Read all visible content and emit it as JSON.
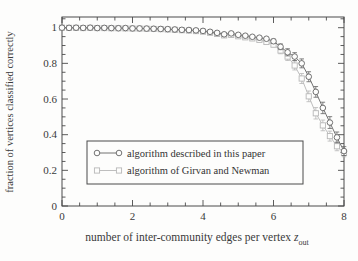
{
  "figure": {
    "background": "#fdfdfc",
    "frame_color": "#4a4a4a",
    "text_color": "#3a3a3a",
    "xlabel": {
      "main": "number of inter-community edges per vertex ",
      "var": "z",
      "sub": "out"
    },
    "ylabel": "fraction of vertices classified correctly",
    "legend": {
      "items": [
        {
          "label": "algorithm described in this paper",
          "marker": "circle"
        },
        {
          "label": "algorithm of Girvan and Newman",
          "marker": "square"
        }
      ]
    }
  },
  "chart_data": {
    "type": "line",
    "title": "",
    "xlabel": "number of inter-community edges per vertex z_out",
    "ylabel": "fraction of vertices classified correctly",
    "xlim": [
      0,
      8
    ],
    "ylim": [
      0,
      1.06
    ],
    "xticks": {
      "major": [
        0,
        2,
        4,
        6,
        8
      ],
      "minor_step": 0.5
    },
    "yticks": {
      "major": [
        0,
        0.2,
        0.4,
        0.6,
        0.8,
        1
      ],
      "major_labels": [
        "0",
        "0.2",
        "0.4",
        "0.6",
        "0.8",
        "1"
      ],
      "minor_step": 0.05
    },
    "grid": false,
    "legend_position": "inside lower-left box",
    "x": [
      0,
      0.2,
      0.4,
      0.6,
      0.8,
      1,
      1.2,
      1.4,
      1.6,
      1.8,
      2,
      2.2,
      2.4,
      2.6,
      2.8,
      3,
      3.2,
      3.4,
      3.6,
      3.8,
      4,
      4.2,
      4.4,
      4.6,
      4.8,
      5,
      5.2,
      5.4,
      5.6,
      5.8,
      6,
      6.2,
      6.4,
      6.6,
      6.8,
      7,
      7.2,
      7.4,
      7.6,
      7.8,
      8
    ],
    "series": [
      {
        "name": "algorithm described in this paper",
        "marker": "circle",
        "color": "#636363",
        "values": [
          1.0,
          0.999,
          1.0,
          0.999,
          1.0,
          0.998,
          0.999,
          0.998,
          0.997,
          0.998,
          0.996,
          0.996,
          0.995,
          0.994,
          0.993,
          0.992,
          0.99,
          0.988,
          0.987,
          0.985,
          0.982,
          0.977,
          0.971,
          0.963,
          0.968,
          0.96,
          0.955,
          0.949,
          0.944,
          0.938,
          0.924,
          0.893,
          0.862,
          0.838,
          0.8,
          0.725,
          0.64,
          0.55,
          0.468,
          0.385,
          0.308
        ],
        "errors": [
          0,
          0,
          0,
          0,
          0,
          0,
          0,
          0,
          0,
          0,
          0,
          0,
          0,
          0,
          0,
          0,
          0,
          0,
          0,
          0,
          0,
          0,
          0,
          0,
          0,
          0,
          0,
          0,
          0,
          0,
          0.012,
          0.016,
          0.02,
          0.022,
          0.025,
          0.028,
          0.03,
          0.032,
          0.033,
          0.03,
          0.025
        ]
      },
      {
        "name": "algorithm of Girvan and Newman",
        "marker": "square",
        "color": "#b7b7b7",
        "values": [
          1.0,
          0.999,
          0.999,
          0.998,
          0.999,
          0.998,
          0.998,
          0.997,
          0.997,
          0.996,
          0.995,
          0.995,
          0.994,
          0.993,
          0.992,
          0.99,
          0.988,
          0.986,
          0.984,
          0.981,
          0.978,
          0.972,
          0.965,
          0.957,
          0.96,
          0.952,
          0.946,
          0.94,
          0.932,
          0.92,
          0.905,
          0.872,
          0.838,
          0.788,
          0.715,
          0.615,
          0.52,
          0.452,
          0.392,
          0.335,
          0.298
        ],
        "errors": [
          0,
          0,
          0,
          0,
          0,
          0,
          0,
          0,
          0,
          0,
          0,
          0,
          0,
          0,
          0,
          0,
          0,
          0,
          0,
          0,
          0,
          0,
          0,
          0,
          0,
          0,
          0,
          0,
          0,
          0,
          0.012,
          0.018,
          0.022,
          0.025,
          0.028,
          0.03,
          0.032,
          0.03,
          0.028,
          0.025,
          0.022
        ]
      }
    ]
  }
}
